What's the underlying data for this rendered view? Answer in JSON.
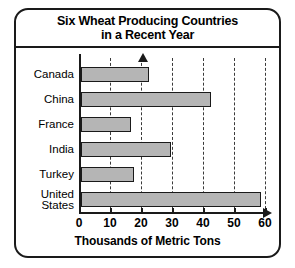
{
  "chart_data": {
    "type": "bar",
    "orientation": "horizontal",
    "title": "Six Wheat Producing Countries in a Recent Year",
    "title_lines": [
      "Six Wheat Producing Countries",
      "in a Recent Year"
    ],
    "categories": [
      "Canada",
      "China",
      "France",
      "India",
      "Turkey",
      "United States"
    ],
    "category_label_lines": [
      [
        "Canada"
      ],
      [
        "China"
      ],
      [
        "France"
      ],
      [
        "India"
      ],
      [
        "Turkey"
      ],
      [
        "United",
        "States"
      ]
    ],
    "values": [
      22,
      42,
      16,
      29,
      17,
      58
    ],
    "xlabel": "Thousands of Metric Tons",
    "ylabel": "",
    "xlim": [
      0,
      60
    ],
    "xticks": [
      0,
      10,
      20,
      30,
      40,
      50,
      60
    ],
    "xtick_labels": [
      "0",
      "10",
      "20",
      "30",
      "40",
      "50",
      "60"
    ],
    "grid": true,
    "grid_axis": "x",
    "grid_style": "dashed",
    "legend": false,
    "colors": {
      "bar_fill": "#b5b5b5",
      "bar_outline": "#1a1a1a",
      "axis": "#1a1a1a",
      "grid": "#3a3a3a",
      "text": "#000000",
      "background": "#ffffff"
    }
  }
}
